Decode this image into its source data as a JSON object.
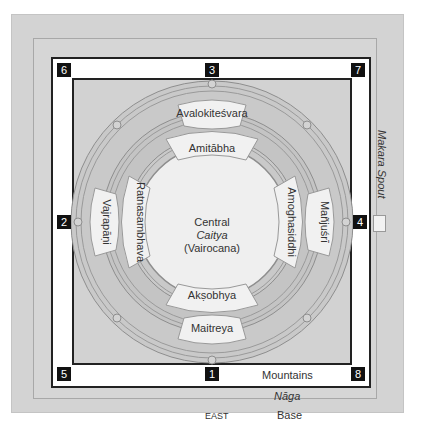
{
  "diagram": {
    "central": {
      "line1": "Central",
      "line2": "Caitya",
      "line3": "(Vairocana)"
    },
    "inner_ring": {
      "north": "Amitābha",
      "south": "Akṣobhya",
      "west": "Ratnasambhava",
      "east": "Amoghasiddhi"
    },
    "outer_ring": {
      "north": "Avalokiteśvara",
      "south": "Maitreya",
      "west": "Vajrapāṇi",
      "east": "Mañjuśrī"
    },
    "markers": {
      "m1": "1",
      "m2": "2",
      "m3": "3",
      "m4": "4",
      "m5": "5",
      "m6": "6",
      "m7": "7",
      "m8": "8"
    },
    "labels": {
      "mountains": "Mountains",
      "naga": "Nāga",
      "base": "Base",
      "east": "EAST",
      "makara_spout": "Makara Spout"
    },
    "colors": {
      "base_gray": "#d3d3d3",
      "ring_gray": "#bdbdbd",
      "petal_fill": "#f0f0f0",
      "marker_bg": "#111111",
      "frame": "#222222"
    }
  }
}
